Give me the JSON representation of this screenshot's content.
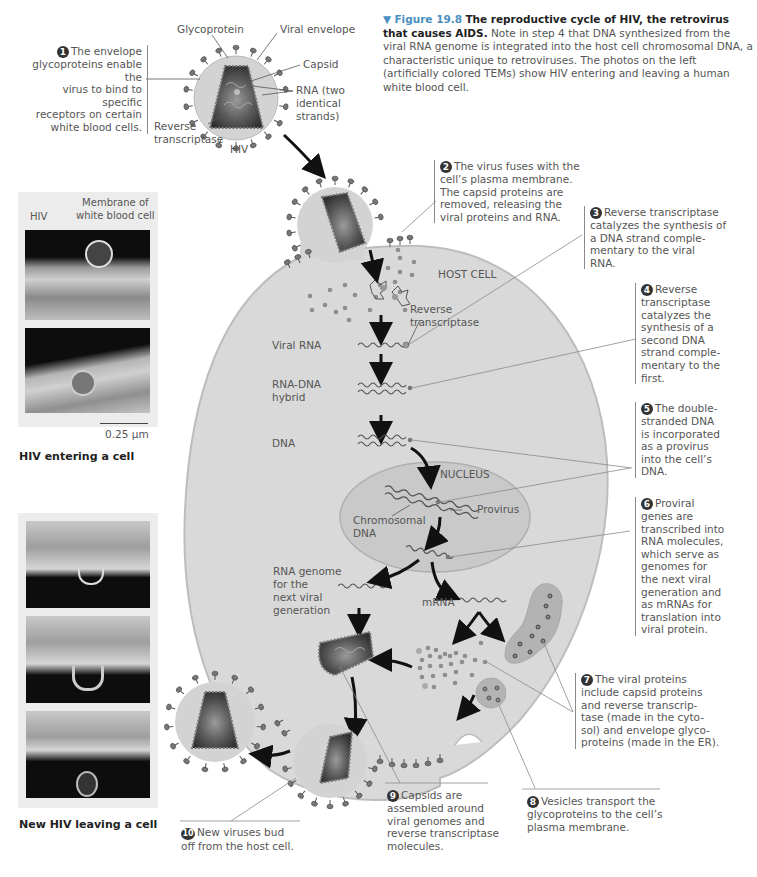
{
  "figure": {
    "number": "Figure 19.8",
    "title": "The reproductive cycle of HIV, the retrovirus that causes AIDS.",
    "caption": "Note in step 4 that DNA synthesized from the viral RNA genome is integrated into the host cell chromosomal DNA, a characteristic unique to retroviruses. The photos on the left (artificially colored TEMs) show HIV entering and leaving a human white blood cell.",
    "marker": "▼"
  },
  "virion_labels": {
    "glycoprotein": "Glycoprotein",
    "viral_envelope": "Viral envelope",
    "capsid": "Capsid",
    "rna": "RNA (two identical strands)",
    "rna_line1": "RNA (two",
    "rna_line2": "identical",
    "rna_line3": "strands)",
    "reverse_transcriptase_line1": "Reverse",
    "reverse_transcriptase_line2": "transcriptase",
    "hiv": "HIV"
  },
  "cell_labels": {
    "host_cell": "HOST CELL",
    "reverse_transcriptase_line1": "Reverse",
    "reverse_transcriptase_line2": "transcriptase",
    "viral_rna": "Viral RNA",
    "rna_dna_hybrid_line1": "RNA-DNA",
    "rna_dna_hybrid_line2": "hybrid",
    "dna": "DNA",
    "nucleus": "NUCLEUS",
    "provirus": "Provirus",
    "chromosomal_dna_line1": "Chromosomal",
    "chromosomal_dna_line2": "DNA",
    "rna_genome_line1": "RNA genome",
    "rna_genome_line2": "for the",
    "rna_genome_line3": "next viral",
    "rna_genome_line4": "generation",
    "mrna": "mRNA"
  },
  "steps": [
    {
      "n": "1",
      "text": "The envelope glycoproteins enable the virus to bind to specific receptors on certain white blood cells.",
      "lines": [
        "The envelope",
        "glycoproteins enable the",
        "virus to bind to specific",
        "receptors on certain",
        "white blood cells."
      ]
    },
    {
      "n": "2",
      "text": "The virus fuses with the cell's plasma membrane. The capsid proteins are removed, releasing the viral proteins and RNA.",
      "lines": [
        "The virus fuses with the",
        "cell’s plasma membrane.",
        "The capsid proteins are",
        "removed, releasing the",
        "viral proteins and RNA."
      ]
    },
    {
      "n": "3",
      "text": "Reverse transcriptase catalyzes the synthesis of a DNA strand complementary to the viral RNA.",
      "lines": [
        "Reverse transcriptase",
        "catalyzes the synthesis of",
        "a DNA strand comple-",
        "mentary to the viral",
        "RNA."
      ]
    },
    {
      "n": "4",
      "text": "Reverse transcriptase catalyzes the synthesis of a second DNA strand complementary to the first.",
      "lines": [
        "Reverse",
        "transcriptase",
        "catalyzes the",
        "synthesis of a",
        "second DNA",
        "strand comple-",
        "mentary to the",
        "first."
      ]
    },
    {
      "n": "5",
      "text": "The double-stranded DNA is incorporated as a provirus into the cell's DNA.",
      "lines": [
        "The double-",
        "stranded DNA",
        "is incorporated",
        "as a provirus",
        "into the cell’s",
        "DNA."
      ]
    },
    {
      "n": "6",
      "text": "Proviral genes are transcribed into RNA molecules, which serve as genomes for the next viral generation and as mRNAs for translation into viral protein.",
      "lines": [
        "Proviral",
        "genes are",
        "transcribed into",
        "RNA molecules,",
        "which serve as",
        "genomes for",
        "the next viral",
        "generation and",
        "as mRNAs for",
        "translation into",
        "viral protein."
      ]
    },
    {
      "n": "7",
      "text": "The viral proteins include capsid proteins and reverse transcriptase (made in the cytosol) and envelope glycoproteins (made in the ER).",
      "lines": [
        "The viral proteins",
        "include capsid proteins",
        "and reverse transcrip-",
        "tase (made in the cyto-",
        "sol) and envelope glyco-",
        "proteins (made in the ER)."
      ]
    },
    {
      "n": "8",
      "text": "Vesicles transport the glycoproteins to the cell's plasma membrane.",
      "lines": [
        "Vesicles transport the",
        "glycoproteins to the cell’s",
        "plasma membrane."
      ]
    },
    {
      "n": "9",
      "text": "Capsids are assembled around viral genomes and reverse transcriptase molecules.",
      "lines": [
        "Capsids are",
        "assembled around",
        "viral genomes and",
        "reverse transcriptase",
        "molecules."
      ]
    },
    {
      "n": "10",
      "text": "New viruses bud off from the host cell.",
      "lines": [
        "New viruses bud",
        "off from the host cell."
      ]
    }
  ],
  "photos": {
    "entering": {
      "hiv_label": "HIV",
      "membrane_label_line1": "Membrane of",
      "membrane_label_line2": "white blood cell",
      "scale_bar": "0.25 µm",
      "caption": "HIV entering a cell"
    },
    "leaving": {
      "caption": "New HIV leaving a cell"
    }
  },
  "colors": {
    "cell_fill": "#d9d9d9",
    "cell_outline": "#bdbdbd",
    "nucleus_fill": "#c9c9c9",
    "virion_envelope": "#d3d3d3",
    "capsid_dark": "#3a3a3a",
    "capsid_mid": "#6e6e6e",
    "figure_number": "#4a8fc0",
    "leader_line": "#8a8a8a",
    "arrow": "#111111"
  }
}
